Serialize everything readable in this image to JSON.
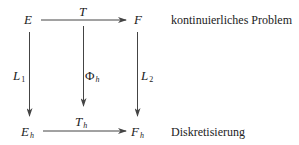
{
  "diagram": {
    "nodes": {
      "E": {
        "main": "E",
        "sub": ""
      },
      "F": {
        "main": "F",
        "sub": ""
      },
      "Eh": {
        "main": "E",
        "sub": "h"
      },
      "Fh": {
        "main": "F",
        "sub": "h"
      }
    },
    "edges": {
      "T": {
        "main": "T",
        "sub": "",
        "from": "E",
        "to": "F"
      },
      "Th": {
        "main": "T",
        "sub": "h",
        "from": "Eh",
        "to": "Fh"
      },
      "L1": {
        "main": "L",
        "sub": "1",
        "from": "E",
        "to": "Eh"
      },
      "L2": {
        "main": "L",
        "sub": "2",
        "from": "F",
        "to": "Fh"
      },
      "Phih": {
        "main": "Φ",
        "sub": "h",
        "from": "T",
        "to": "Th"
      }
    },
    "row_labels": {
      "top": "kontinuierliches Problem",
      "bottom": "Diskretisierung"
    },
    "colors": {
      "line": "#444444",
      "text": "#222222",
      "background": "#ffffff"
    }
  }
}
